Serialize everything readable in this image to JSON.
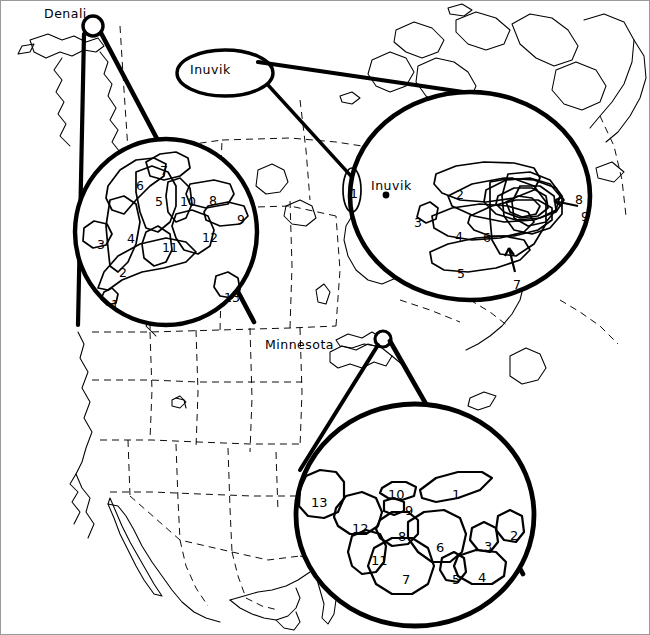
{
  "figure": {
    "type": "map-with-insets",
    "background_color": "#ffffff",
    "line_color": "#000000",
    "border_color": "#9a9a9a",
    "width": 650,
    "height": 635
  },
  "site_labels": [
    {
      "name": "denali",
      "text": "Denali",
      "x": 44,
      "y": 6
    },
    {
      "name": "inuvik-small",
      "text": "Inuvik",
      "x": 190,
      "y": 62
    },
    {
      "name": "inuvik-inset",
      "text": "Inuvik",
      "x": 371,
      "y": 178
    },
    {
      "name": "minnesota",
      "text": "Minnesota",
      "x": 265,
      "y": 337
    }
  ],
  "insets": [
    {
      "name": "denali-inset",
      "title": "Denali",
      "center_x": 166,
      "center_y": 232,
      "radius_x": 91,
      "radius_y": 93,
      "region_count": 13,
      "regions": [
        {
          "id": "1",
          "label": "1",
          "lx": 111,
          "ly": 297
        },
        {
          "id": "2",
          "label": "2",
          "lx": 119,
          "ly": 265
        },
        {
          "id": "3",
          "label": "3",
          "lx": 97,
          "ly": 237
        },
        {
          "id": "4",
          "label": "4",
          "lx": 127,
          "ly": 231
        },
        {
          "id": "5",
          "label": "5",
          "lx": 155,
          "ly": 194
        },
        {
          "id": "6",
          "label": "6",
          "lx": 136,
          "ly": 178
        },
        {
          "id": "7",
          "label": "7",
          "lx": 160,
          "ly": 163
        },
        {
          "id": "8",
          "label": "8",
          "lx": 209,
          "ly": 193
        },
        {
          "id": "9",
          "label": "9",
          "lx": 237,
          "ly": 212
        },
        {
          "id": "10",
          "label": "10",
          "lx": 180,
          "ly": 194
        },
        {
          "id": "11",
          "label": "11",
          "lx": 162,
          "ly": 240
        },
        {
          "id": "12",
          "label": "12",
          "lx": 202,
          "ly": 230
        },
        {
          "id": "13",
          "label": "13",
          "lx": 224,
          "ly": 290
        }
      ]
    },
    {
      "name": "inuvik-inset",
      "title": "Inuvik",
      "center_x": 470,
      "center_y": 196,
      "radius_x": 120,
      "radius_y": 104,
      "region_count": 9,
      "site_dot": {
        "x": 386,
        "y": 195
      },
      "regions": [
        {
          "id": "1",
          "label": "1",
          "lx": 350,
          "ly": 186
        },
        {
          "id": "2",
          "label": "2",
          "lx": 456,
          "ly": 187
        },
        {
          "id": "3",
          "label": "3",
          "lx": 414,
          "ly": 215
        },
        {
          "id": "4",
          "label": "4",
          "lx": 455,
          "ly": 229
        },
        {
          "id": "5",
          "label": "5",
          "lx": 457,
          "ly": 266
        },
        {
          "id": "6",
          "label": "6",
          "lx": 483,
          "ly": 230
        },
        {
          "id": "7",
          "label": "7",
          "lx": 513,
          "ly": 277
        },
        {
          "id": "8",
          "label": "8",
          "lx": 575,
          "ly": 192
        },
        {
          "id": "9",
          "label": "9",
          "lx": 581,
          "ly": 209
        }
      ]
    },
    {
      "name": "minnesota-inset",
      "title": "Minnesota",
      "center_x": 415,
      "center_y": 515,
      "radius_x": 119,
      "radius_y": 111,
      "region_count": 13,
      "regions": [
        {
          "id": "1",
          "label": "1",
          "lx": 452,
          "ly": 487
        },
        {
          "id": "2",
          "label": "2",
          "lx": 510,
          "ly": 528
        },
        {
          "id": "3",
          "label": "3",
          "lx": 484,
          "ly": 539
        },
        {
          "id": "4",
          "label": "4",
          "lx": 478,
          "ly": 570
        },
        {
          "id": "5",
          "label": "5",
          "lx": 452,
          "ly": 572
        },
        {
          "id": "6",
          "label": "6",
          "lx": 436,
          "ly": 540
        },
        {
          "id": "7",
          "label": "7",
          "lx": 402,
          "ly": 572
        },
        {
          "id": "8",
          "label": "8",
          "lx": 398,
          "ly": 529
        },
        {
          "id": "9",
          "label": "9",
          "lx": 405,
          "ly": 503
        },
        {
          "id": "10",
          "label": "10",
          "lx": 394,
          "ly": 490
        },
        {
          "id": "11",
          "label": "11",
          "lx": 371,
          "ly": 553
        },
        {
          "id": "12",
          "label": "12",
          "lx": 355,
          "ly": 521
        },
        {
          "id": "13",
          "label": "13",
          "lx": 314,
          "ly": 495
        }
      ]
    }
  ],
  "markers": [
    {
      "name": "denali-marker",
      "shape": "circle",
      "x": 93,
      "y": 26,
      "r": 10
    },
    {
      "name": "inuvik-marker",
      "shape": "ellipse",
      "x": 225,
      "y": 73,
      "rx": 48,
      "ry": 23
    },
    {
      "name": "minnesota-marker",
      "shape": "circle",
      "x": 383,
      "y": 339,
      "r": 8
    }
  ]
}
